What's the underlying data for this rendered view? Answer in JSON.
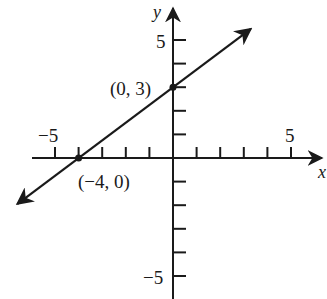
{
  "chart_data": {
    "type": "line",
    "title": "",
    "xlabel": "x",
    "ylabel": "y",
    "xlim": [
      -6,
      6
    ],
    "ylim": [
      -5.5,
      5.5
    ],
    "grid": false,
    "x_ticks": [
      -5,
      -4,
      -3,
      -2,
      -1,
      1,
      2,
      3,
      4,
      5
    ],
    "y_ticks": [
      -5,
      -4,
      -3,
      -2,
      -1,
      1,
      2,
      3,
      4,
      5
    ],
    "x_tick_labels": {
      "-5": "−5",
      "5": "5"
    },
    "y_tick_labels": {
      "5": "5",
      "-5": "−5"
    },
    "series": [
      {
        "name": "line",
        "equation": "y = (3/4)x + 3",
        "slope": 0.75,
        "intercept": 3,
        "x": [
          -6.6,
          3.3
        ],
        "y": [
          -1.95,
          5.475
        ],
        "arrows": "both",
        "color": "#1a1a1a"
      }
    ],
    "points": [
      {
        "x": 0,
        "y": 3,
        "label": "(0, 3)"
      },
      {
        "x": -4,
        "y": 0,
        "label": "(−4, 0)"
      }
    ],
    "annotations": [
      "(0, 3)",
      "(−4, 0)"
    ]
  },
  "labels": {
    "x_axis": "x",
    "y_axis": "y",
    "x_neg5": "−5",
    "x_pos5": "5",
    "y_pos5": "5",
    "y_neg5": "−5",
    "point_a": "(0, 3)",
    "point_b": "(−4, 0)"
  },
  "colors": {
    "ink": "#1a1a1a",
    "background": "#ffffff"
  }
}
